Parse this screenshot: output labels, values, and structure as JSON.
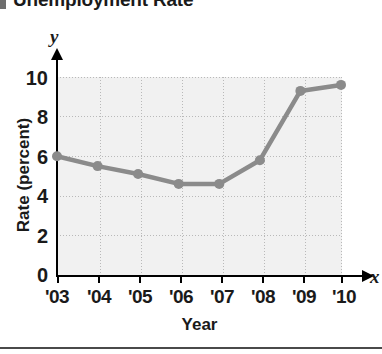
{
  "title": "Unemployment Rate",
  "axis_vars": {
    "y": "y",
    "x": "x"
  },
  "colors": {
    "series": "#8b8b8b",
    "plot_background": "#f1f1f1",
    "gridline": "#b9b9b9",
    "axis": "#000000",
    "title_accent": "#6e6e6e"
  },
  "chart_data": {
    "type": "line",
    "title": "Unemployment Rate",
    "xlabel": "Year",
    "ylabel": "Rate (percent)",
    "categories": [
      "'03",
      "'04",
      "'05",
      "'06",
      "'07",
      "'08",
      "'09",
      "'10"
    ],
    "x": [
      2003,
      2004,
      2005,
      2006,
      2007,
      2008,
      2009,
      2010
    ],
    "values": [
      6.0,
      5.5,
      5.1,
      4.6,
      4.6,
      5.8,
      9.3,
      9.6
    ],
    "series": [
      {
        "name": "Unemployment Rate",
        "values": [
          6.0,
          5.5,
          5.1,
          4.6,
          4.6,
          5.8,
          9.3,
          9.6
        ]
      }
    ],
    "ylim": [
      0,
      10.6
    ],
    "xlim": [
      2003,
      2010
    ],
    "ytick_labels": [
      "10",
      "8",
      "6",
      "4",
      "2",
      "0"
    ],
    "ytick_values": [
      10,
      8,
      6,
      4,
      2,
      0
    ],
    "xtick_labels": [
      "'03",
      "'04",
      "'05",
      "'06",
      "'07",
      "'08",
      "'09",
      "'10"
    ],
    "grid": true,
    "legend": "none",
    "markers": "filled-circle"
  }
}
